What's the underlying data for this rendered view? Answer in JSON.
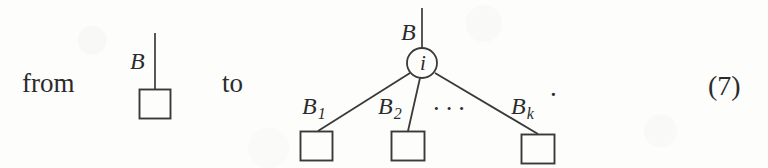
{
  "figure": {
    "kind": "tex-equation-figure",
    "equation_number": "(7)",
    "trailing_punctuation": ".",
    "ink_color": "#3a3a3a",
    "paper_color": "#fdfdfc",
    "prose": {
      "from_label": "from",
      "to_label": "to"
    },
    "left_diagram": {
      "name": "single-hole-tree",
      "edge_label": "B",
      "boxes": 1
    },
    "right_diagram": {
      "name": "expanded-node-tree",
      "root_edge_label": "B",
      "node_label": "i",
      "ellipsis": "···",
      "branch_labels": [
        {
          "base": "B",
          "sub": "1"
        },
        {
          "base": "B",
          "sub": "2"
        },
        {
          "base": "B",
          "sub": "k"
        }
      ],
      "boxes": 3
    }
  }
}
